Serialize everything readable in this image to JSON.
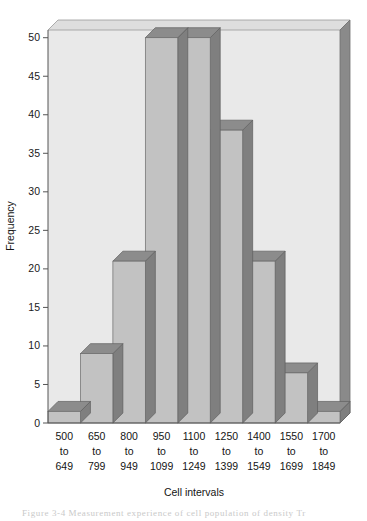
{
  "figure": {
    "caption": "Figure 3-4  Measurement experience of cell population of density Tr",
    "background_color": "#ffffff"
  },
  "chart_data": {
    "type": "bar",
    "title": "",
    "xlabel": "Cell intervals",
    "ylabel": "Frequency",
    "categories": [
      "500\nto\n649",
      "650\nto\n799",
      "800\nto\n949",
      "950\nto\n1099",
      "1100\nto\n1249",
      "1250\nto\n1399",
      "1400\nto\n1549",
      "1550\nto\n1699",
      "1700\nto\n1849"
    ],
    "category_lines": [
      [
        "500",
        "to",
        "649"
      ],
      [
        "650",
        "to",
        "799"
      ],
      [
        "800",
        "to",
        "949"
      ],
      [
        "950",
        "to",
        "1099"
      ],
      [
        "1100",
        "to",
        "1249"
      ],
      [
        "1250",
        "to",
        "1399"
      ],
      [
        "1400",
        "to",
        "1549"
      ],
      [
        "1550",
        "to",
        "1699"
      ],
      [
        "1700",
        "to",
        "1849"
      ]
    ],
    "values": [
      1.5,
      9,
      21,
      50,
      50,
      38,
      21,
      6.5,
      1.5
    ],
    "ylim": [
      0,
      51
    ],
    "yticks": [
      0,
      5,
      10,
      15,
      20,
      25,
      30,
      35,
      40,
      45,
      50
    ],
    "ytick_labels": [
      "0",
      "5",
      "10",
      "15",
      "20",
      "25",
      "30",
      "35",
      "40",
      "45",
      "50"
    ],
    "grid": false,
    "legend": null,
    "style": "3d-shaded-histogram",
    "colors": {
      "bar_face": "#c2c2c2",
      "bar_top": "#8c8c8c",
      "bar_side": "#7f7f7f",
      "plot_background": "#e9e9e9",
      "frame_top": "#dedede",
      "frame_right": "#8a8a8a",
      "axis_line": "#555555",
      "text": "#141414"
    }
  }
}
